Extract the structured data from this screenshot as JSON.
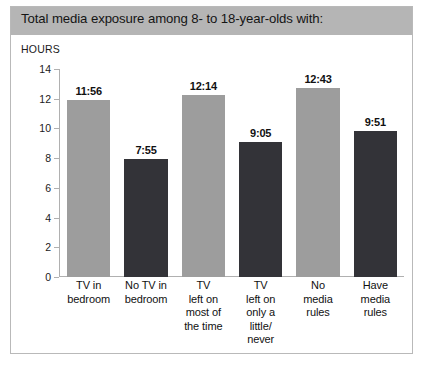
{
  "header": {
    "title": "Total media exposure among 8- to 18-year-olds with:"
  },
  "axis_unit_label": "HOURS",
  "colors": {
    "header_band": "#b5b5b5",
    "bar_gray": "#9d9d9d",
    "bar_dark": "#333338",
    "panel_border": "#b9b9b9",
    "axis": "#b0b0b0",
    "text": "#111111"
  },
  "chart_data": {
    "type": "bar",
    "title": "Total media exposure among 8- to 18-year-olds with:",
    "xlabel": "",
    "ylabel": "HOURS",
    "ylim": [
      0,
      14
    ],
    "yticks": [
      0,
      2,
      4,
      6,
      8,
      10,
      12,
      14
    ],
    "grid": false,
    "legend": "none",
    "categories": [
      "TV in bedroom",
      "No TV in bedroom",
      "TV left on most of the time",
      "TV left on only a little/ never",
      "No media rules",
      "Have media rules"
    ],
    "category_lines": [
      [
        "TV in",
        "bedroom"
      ],
      [
        "No TV in",
        "bedroom"
      ],
      [
        "TV",
        "left on",
        "most of",
        "the time"
      ],
      [
        "TV",
        "left on",
        "only a",
        "little/",
        "never"
      ],
      [
        "No",
        "media",
        "rules"
      ],
      [
        "Have",
        "media",
        "rules"
      ]
    ],
    "data_labels": [
      "11:56",
      "7:55",
      "12:14",
      "9:05",
      "12:43",
      "9:51"
    ],
    "values": [
      11.93,
      7.92,
      12.23,
      9.08,
      12.72,
      9.85
    ],
    "bar_colors": [
      "#9d9d9d",
      "#333338",
      "#9d9d9d",
      "#333338",
      "#9d9d9d",
      "#333338"
    ]
  }
}
